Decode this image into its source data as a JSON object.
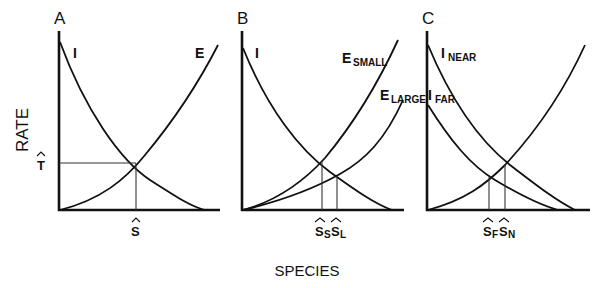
{
  "figure": {
    "y_axis_label": "RATE",
    "x_axis_label": "SPECIES",
    "panels": [
      {
        "letter": "A",
        "curves": [
          {
            "name": "I",
            "label": "I",
            "subscript": "",
            "type": "immigration"
          },
          {
            "name": "E",
            "label": "E",
            "subscript": "",
            "type": "extinction"
          }
        ],
        "equilibrium_labels": {
          "species": "S",
          "species_sub": "",
          "rate": "T"
        }
      },
      {
        "letter": "B",
        "curves": [
          {
            "name": "I",
            "label": "I",
            "subscript": "",
            "type": "immigration"
          },
          {
            "name": "E_SMALL",
            "label": "E",
            "subscript": "SMALL",
            "type": "extinction"
          },
          {
            "name": "E_LARGE",
            "label": "E",
            "subscript": "LARGE",
            "type": "extinction"
          }
        ],
        "equilibrium_labels": [
          {
            "species": "S",
            "species_sub": "S"
          },
          {
            "species": "S",
            "species_sub": "L"
          }
        ]
      },
      {
        "letter": "C",
        "curves": [
          {
            "name": "I_NEAR",
            "label": "I",
            "subscript": "NEAR",
            "type": "immigration"
          },
          {
            "name": "I_FAR",
            "label": "I",
            "subscript": "FAR",
            "type": "immigration"
          },
          {
            "name": "E",
            "label": "",
            "subscript": "",
            "type": "extinction"
          }
        ],
        "equilibrium_labels": [
          {
            "species": "S",
            "species_sub": "F"
          },
          {
            "species": "S",
            "species_sub": "N"
          }
        ]
      }
    ]
  },
  "labels": {
    "A": "A",
    "B": "B",
    "C": "C",
    "A_I": "I",
    "A_E": "E",
    "A_T": "T",
    "A_S": "S",
    "B_I": "I",
    "B_Esmall_main": "E",
    "B_Esmall_sub": "SMALL",
    "B_Elarge_main": "E",
    "B_Elarge_sub": "LARGE",
    "B_S1": "S",
    "B_S1_sub": "S",
    "B_S2": "S",
    "B_S2_sub": "L",
    "C_Inear_main": "I",
    "C_Inear_sub": "NEAR",
    "C_Ifar_main": "I",
    "C_Ifar_sub": "FAR",
    "C_S1": "S",
    "C_S1_sub": "F",
    "C_S2": "S",
    "C_S2_sub": "N",
    "ylabel": "RATE",
    "xlabel": "SPECIES"
  }
}
